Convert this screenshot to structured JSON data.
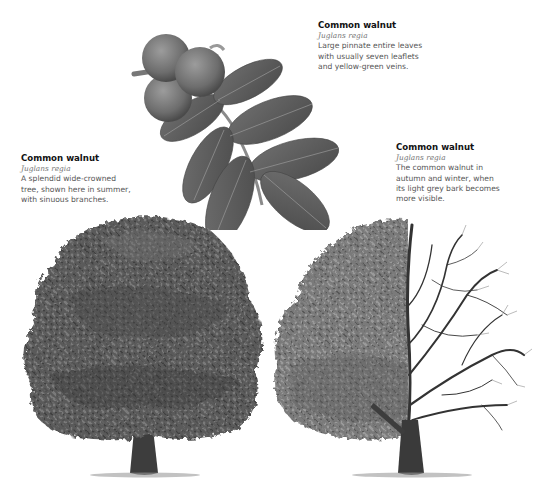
{
  "captions": {
    "leaf": {
      "title": "Common walnut",
      "latin": "Juglans regia",
      "lines": [
        "Large pinnate entire leaves",
        "with usually seven leaflets",
        "and yellow-green veins."
      ]
    },
    "summer": {
      "title": "Common walnut",
      "latin": "Juglans regia",
      "lines": [
        "A splendid wide-crowned",
        "tree, shown here in summer,",
        "with sinuous branches."
      ]
    },
    "winter": {
      "title": "Common walnut",
      "latin": "Juglans regia",
      "lines": [
        "The common walnut in",
        "autumn and winter, when",
        "its light grey bark becomes",
        "more visible."
      ]
    }
  },
  "illustrations": {
    "leaf_branch": "walnut-leaf-and-fruit",
    "summer_tree": "walnut-tree-summer",
    "winter_tree": "walnut-tree-half-leafed-half-bare"
  },
  "colors": {
    "background": "#ffffff",
    "title": "#111111",
    "latin": "#777777",
    "body": "#555555",
    "foliage_dark": "#3d3d3d",
    "foliage_mid": "#6a6a6a",
    "foliage_light": "#8c8c8c",
    "trunk": "#3a3a3a"
  }
}
